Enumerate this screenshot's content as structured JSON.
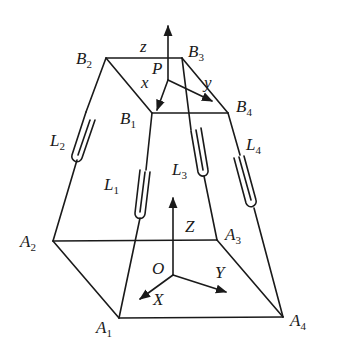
{
  "diagram": {
    "colors": {
      "line": "#1a1a1a",
      "background": "#ffffff"
    },
    "platform": {
      "vertices": [
        {
          "name": "B",
          "sub": "1"
        },
        {
          "name": "B",
          "sub": "2"
        },
        {
          "name": "B",
          "sub": "3"
        },
        {
          "name": "B",
          "sub": "4"
        }
      ],
      "center": "P",
      "axes": {
        "x": "x",
        "y": "y",
        "z": "z"
      }
    },
    "base": {
      "vertices": [
        {
          "name": "A",
          "sub": "1"
        },
        {
          "name": "A",
          "sub": "2"
        },
        {
          "name": "A",
          "sub": "3"
        },
        {
          "name": "A",
          "sub": "4"
        }
      ],
      "origin": "O",
      "axes": {
        "X": "X",
        "Y": "Y",
        "Z": "Z"
      }
    },
    "legs": [
      {
        "name": "L",
        "sub": "1"
      },
      {
        "name": "L",
        "sub": "2"
      },
      {
        "name": "L",
        "sub": "3"
      },
      {
        "name": "L",
        "sub": "4"
      }
    ]
  }
}
